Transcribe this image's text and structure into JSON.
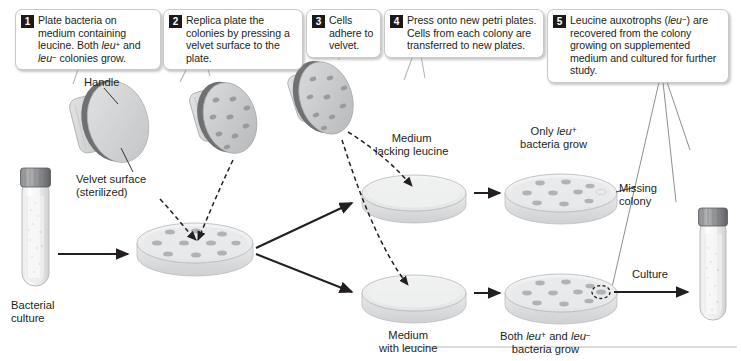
{
  "figure": {
    "steps": [
      {
        "number": "1",
        "text_html": "Plate bacteria on medium containing leucine. Both <i>leu</i><span class=\"sup\">+</span> and <i>leu</i><span class=\"sup\">−</span> colonies grow."
      },
      {
        "number": "2",
        "text_html": "Replica plate the colonies by pressing a velvet surface to the plate."
      },
      {
        "number": "3",
        "text_html": "Cells adhere to velvet."
      },
      {
        "number": "4",
        "text_html": "Press onto new petri plates. Cells from each colony are transferred to new plates."
      },
      {
        "number": "5",
        "text_html": "Leucine auxotrophs (<i>leu</i><span class=\"sup\">−</span>) are recovered from the colony growing on supplemented medium and cultured for further study."
      }
    ],
    "labels": {
      "handle": "Handle",
      "velvet_surface": "Velvet surface (sterilized)",
      "bacterial_culture": "Bacterial culture",
      "medium_lacking_leucine_html": "Medium<br>lacking leucine",
      "only_leu_plus_html": "Only <i>leu</i><span class=\"sup\">+</span><br>bacteria grow",
      "missing_colony": "Missing colony",
      "medium_with_leucine_html": "Medium<br>with leucine",
      "both_leu_html": "Both <i>leu</i><span class=\"sup\">+</span> and <i>leu</i><span class=\"sup\">−</span><br>bacteria grow",
      "culture": "Culture"
    },
    "objects": {
      "culture_tube_start": "bacterial-culture-tube",
      "culture_tube_end": "recovered-culture-tube",
      "velvet_discs": [
        {
          "name": "velvet-disc-sterile",
          "colonies": 0
        },
        {
          "name": "velvet-disc-pressed",
          "colonies": 9
        },
        {
          "name": "velvet-disc-lifted",
          "colonies": 9
        }
      ],
      "plates": [
        {
          "name": "master-plate",
          "colonies": 10,
          "medium": "containing leucine"
        },
        {
          "name": "plate-lacking-leucine-empty",
          "colonies": 0,
          "medium": "lacking leucine"
        },
        {
          "name": "plate-with-leucine-empty",
          "colonies": 0,
          "medium": "with leucine"
        },
        {
          "name": "plate-only-leu-plus",
          "colonies": 9,
          "missing_colony": true
        },
        {
          "name": "plate-both-leu",
          "colonies": 10,
          "circled_colony": true
        }
      ]
    },
    "colors": {
      "ink": "#231f20",
      "badge_bg": "#1a1a1a",
      "badge_text": "#ffffff",
      "callout_border": "#c9c9c9",
      "plate_fill": "#ececed",
      "plate_rim": "#cfd0d1",
      "velvet_fill": "#c6c7c8",
      "velvet_handle": "#d6d7d8",
      "colony": "#a7a9ac",
      "tube_cap": "#6d6e71",
      "arrow": "#231f20"
    }
  }
}
